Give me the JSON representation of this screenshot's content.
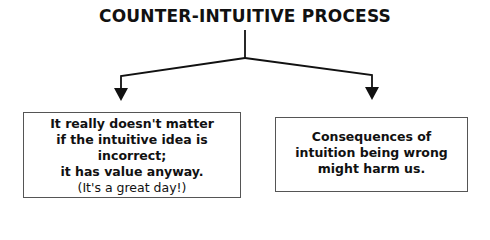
{
  "diagram": {
    "title": "COUNTER-INTUITIVE PROCESS",
    "colors": {
      "line": "#111111",
      "box_border": "#555555",
      "background": "#ffffff",
      "text": "#111111"
    },
    "branches": [
      {
        "id": "left",
        "lines": [
          {
            "text": "It really doesn't matter",
            "weight": "bold"
          },
          {
            "text": "if the intuitive idea is incorrect;",
            "weight": "bold"
          },
          {
            "text": "it has value anyway.",
            "weight": "bold"
          },
          {
            "text": "(It's a great day!)",
            "weight": "normal"
          }
        ]
      },
      {
        "id": "right",
        "lines": [
          {
            "text": "Consequences of",
            "weight": "bold"
          },
          {
            "text": "intuition being wrong",
            "weight": "bold"
          },
          {
            "text": "might harm us.",
            "weight": "bold"
          }
        ]
      }
    ]
  }
}
